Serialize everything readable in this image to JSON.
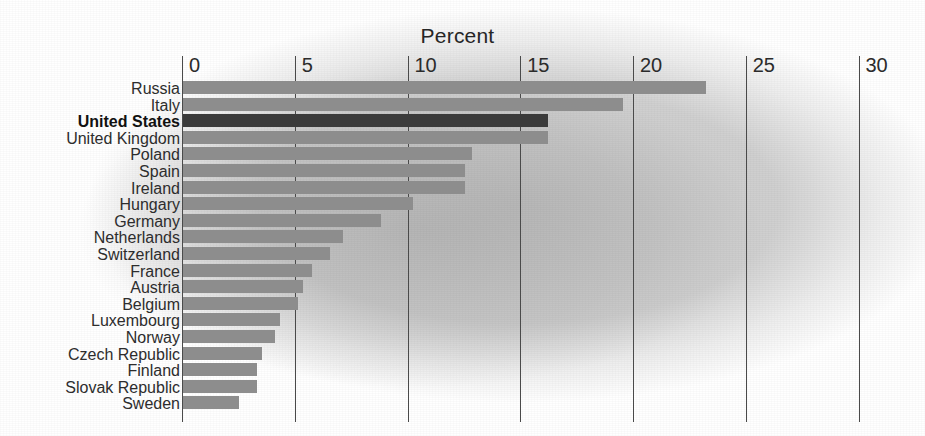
{
  "chart_data": {
    "type": "bar",
    "orientation": "horizontal",
    "title": "Percent",
    "xlabel": "Percent",
    "ylabel": "",
    "xlim": [
      0,
      30
    ],
    "xticks": [
      0,
      5,
      10,
      15,
      20,
      25,
      30
    ],
    "xtick_labels": [
      "0",
      "5",
      "10",
      "15",
      "20",
      "25",
      "30"
    ],
    "grid": true,
    "legend": "none",
    "highlight_category": "United States",
    "colors": {
      "bar": "#8d8d8d",
      "bar_highlight": "#3b3b3b",
      "gridline": "#4a4a4a",
      "text": "#2d2d2d",
      "background": "#b9b9b9"
    },
    "categories": [
      "Russia",
      "Italy",
      "United States",
      "United Kingdom",
      "Poland",
      "Spain",
      "Ireland",
      "Hungary",
      "Germany",
      "Netherlands",
      "Switzerland",
      "France",
      "Austria",
      "Belgium",
      "Luxembourg",
      "Norway",
      "Czech Republic",
      "Finland",
      "Slovak Republic",
      "Sweden"
    ],
    "values": [
      23.2,
      19.5,
      16.2,
      16.2,
      12.8,
      12.5,
      12.5,
      10.2,
      8.8,
      7.1,
      6.5,
      5.7,
      5.3,
      5.1,
      4.3,
      4.1,
      3.5,
      3.3,
      3.3,
      2.5
    ]
  }
}
